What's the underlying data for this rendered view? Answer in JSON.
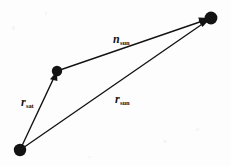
{
  "figure": {
    "type": "vector-diagram",
    "background_color": "#fdfdfd",
    "ink_color": "#131313",
    "width": 231,
    "height": 166,
    "nodes": [
      {
        "id": "origin",
        "name": "origin-node",
        "x": 20,
        "y": 150,
        "radius": 6.2
      },
      {
        "id": "satellite",
        "name": "satellite-node",
        "x": 57,
        "y": 71,
        "radius": 5.2
      },
      {
        "id": "sun",
        "name": "sun-node",
        "x": 211,
        "y": 18,
        "radius": 6.4
      }
    ],
    "vectors": [
      {
        "id": "r_sat",
        "label": "r",
        "subscript": "sat",
        "from": "origin",
        "to": "satellite",
        "label_x": 21,
        "label_y": 96
      },
      {
        "id": "r_sun",
        "label": "r",
        "subscript": "sun",
        "from": "origin",
        "to": "sun",
        "label_x": 115,
        "label_y": 93
      },
      {
        "id": "n_sun",
        "label": "n",
        "subscript": "sun",
        "from": "satellite",
        "to": "sun",
        "label_x": 113,
        "label_y": 33
      }
    ]
  }
}
